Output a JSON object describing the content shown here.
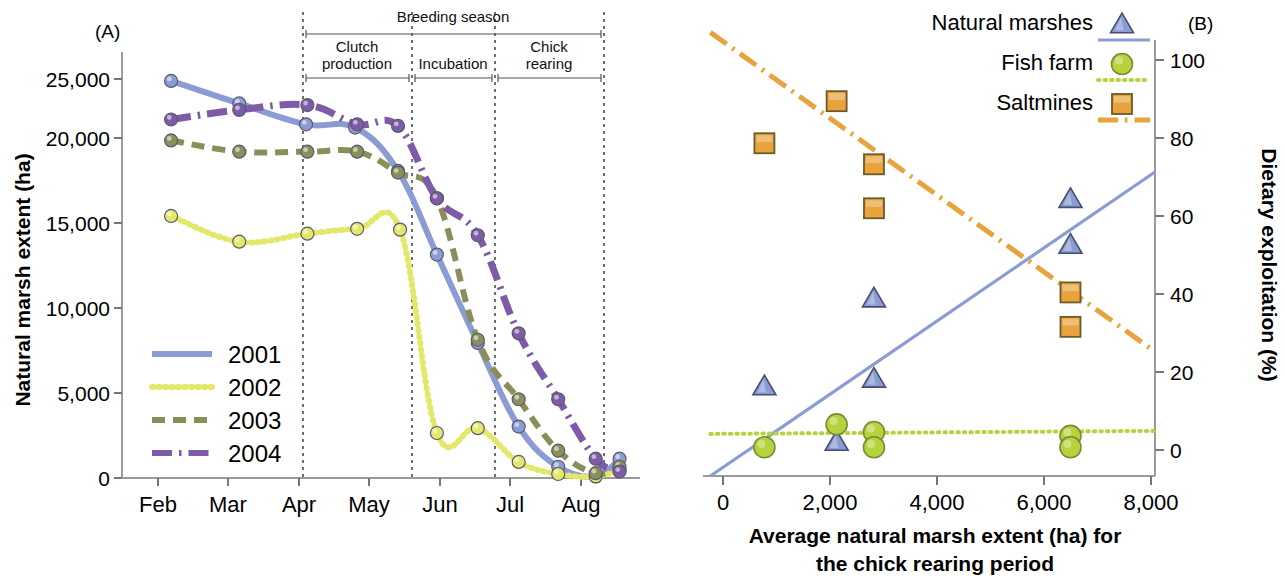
{
  "figure": {
    "panel_a_label": "(A)",
    "panel_b_label": "(B)"
  },
  "panel_a": {
    "ylabel": "Natural marsh extent (ha)",
    "y_ticks": [
      "0",
      "5,000",
      "10,000",
      "15,000",
      "20,000",
      "25,000"
    ],
    "x_ticks": [
      "Feb",
      "Mar",
      "Apr",
      "May",
      "Jun",
      "Jul",
      "Aug"
    ],
    "legend": [
      {
        "label": "2001",
        "color": "#8b9bd4",
        "style": "solid"
      },
      {
        "label": "2002",
        "color": "#e4e86a",
        "style": "dotted"
      },
      {
        "label": "2003",
        "color": "#8a8f5a",
        "style": "dashed"
      },
      {
        "label": "2004",
        "color": "#7d5ba6",
        "style": "dashdot"
      }
    ],
    "annotations": {
      "breeding_season": "Breeding season",
      "clutch_production": "Clutch production",
      "incubation": "Incubation",
      "chick_rearing": "Chick rearing"
    }
  },
  "panel_b": {
    "xlabel_line1": "Average natural marsh extent (ha) for",
    "xlabel_line2": "the chick rearing period",
    "ylabel": "Dietary exploitation (%)",
    "x_ticks": [
      "0",
      "2,000",
      "4,000",
      "6,000",
      "8,000"
    ],
    "y_ticks": [
      "0",
      "20",
      "40",
      "60",
      "80",
      "100"
    ],
    "legend": [
      {
        "label": "Natural marshes",
        "color": "#8b9bd4",
        "marker": "triangle",
        "style": "solid"
      },
      {
        "label": "Fish farm",
        "color": "#b5d33d",
        "marker": "circle",
        "style": "dotted"
      },
      {
        "label": "Saltmines",
        "color": "#e8a33d",
        "marker": "square",
        "style": "dashdot"
      }
    ]
  },
  "chart_data": [
    {
      "type": "line",
      "id": "panel-a",
      "title": "",
      "xlabel": "",
      "ylabel": "Natural marsh extent (ha)",
      "xlim": [
        0,
        7.6
      ],
      "ylim": [
        0,
        26500
      ],
      "x_tick_labels": [
        "Feb",
        "Mar",
        "Apr",
        "May",
        "Jun",
        "Jul",
        "Aug"
      ],
      "x_tick_values": [
        1,
        2,
        3,
        4,
        5,
        6,
        7
      ],
      "y_tick_values": [
        0,
        5000,
        10000,
        15000,
        20000,
        25000
      ],
      "grid": false,
      "legend_position": "left-lower",
      "series": [
        {
          "name": "2001",
          "color": "#8b9bd4",
          "style": "solid",
          "marker": "circle",
          "x": [
            0.72,
            1.72,
            2.7,
            3.42,
            4.05,
            4.62,
            5.22,
            5.82,
            6.4,
            6.95,
            7.3
          ],
          "y": [
            24700,
            23300,
            22000,
            21800,
            19100,
            13900,
            8400,
            3200,
            700,
            100,
            1200
          ]
        },
        {
          "name": "2002",
          "color": "#e4e86a",
          "style": "dotted",
          "marker": "circle",
          "x": [
            0.72,
            1.72,
            2.72,
            3.45,
            4.08,
            4.62,
            5.22,
            5.82,
            6.4,
            6.95,
            7.3
          ],
          "y": [
            16300,
            14700,
            15200,
            15500,
            15450,
            2800,
            3100,
            1000,
            250,
            100,
            500
          ]
        },
        {
          "name": "2003",
          "color": "#8a8f5a",
          "style": "dashed",
          "marker": "circle",
          "x": [
            0.72,
            1.72,
            2.72,
            3.45,
            4.05,
            4.62,
            5.22,
            5.82,
            6.4,
            6.95,
            7.3
          ],
          "y": [
            21000,
            20300,
            20300,
            20300,
            19000,
            17400,
            8600,
            4900,
            1700,
            300,
            700
          ]
        },
        {
          "name": "2004",
          "color": "#7d5ba6",
          "style": "dashdot",
          "marker": "circle",
          "x": [
            0.72,
            1.72,
            2.72,
            3.45,
            4.05,
            4.62,
            5.22,
            5.82,
            6.4,
            6.95,
            7.3
          ],
          "y": [
            22300,
            22900,
            23200,
            22000,
            21900,
            17400,
            15100,
            9000,
            4900,
            1200,
            400
          ]
        }
      ]
    },
    {
      "type": "scatter",
      "id": "panel-b",
      "title": "",
      "xlabel": "Average natural marsh extent (ha) for the chick rearing period",
      "ylabel": "Dietary exploitation (%)",
      "xlim": [
        -400,
        8800
      ],
      "ylim": [
        -6,
        108
      ],
      "x_tick_values": [
        0,
        2000,
        4000,
        6000,
        8000
      ],
      "y_tick_values": [
        0,
        20,
        40,
        60,
        80,
        100
      ],
      "grid": false,
      "legend_position": "top-right",
      "series": [
        {
          "name": "Natural marshes",
          "color": "#8b9bd4",
          "marker": "triangle",
          "style": "solid",
          "points": [
            {
              "x": 850,
              "y": 17.5
            },
            {
              "x": 2320,
              "y": 3.0
            },
            {
              "x": 3080,
              "y": 40.5
            },
            {
              "x": 3080,
              "y": 19.5
            },
            {
              "x": 7080,
              "y": 66.5
            },
            {
              "x": 7080,
              "y": 54.5
            }
          ],
          "trend": {
            "x1": -250,
            "y1": -6,
            "x2": 8800,
            "y2": 73.5
          }
        },
        {
          "name": "Fish farm",
          "color": "#b5d33d",
          "marker": "circle",
          "style": "dotted",
          "points": [
            {
              "x": 850,
              "y": 1.5
            },
            {
              "x": 2320,
              "y": 7.5
            },
            {
              "x": 3080,
              "y": 5.5
            },
            {
              "x": 3080,
              "y": 1.5
            },
            {
              "x": 7080,
              "y": 4.5
            },
            {
              "x": 7080,
              "y": 1.5
            }
          ],
          "trend": {
            "x1": -250,
            "y1": 5.0,
            "x2": 8800,
            "y2": 5.8
          }
        },
        {
          "name": "Saltmines",
          "color": "#e8a33d",
          "marker": "square",
          "style": "dashdot",
          "points": [
            {
              "x": 850,
              "y": 81.0
            },
            {
              "x": 2320,
              "y": 92.0
            },
            {
              "x": 3080,
              "y": 75.5
            },
            {
              "x": 3080,
              "y": 64.0
            },
            {
              "x": 7080,
              "y": 42.0
            },
            {
              "x": 7080,
              "y": 33.0
            }
          ],
          "trend": {
            "x1": -250,
            "y1": 110,
            "x2": 8800,
            "y2": 26.5
          }
        }
      ]
    }
  ]
}
